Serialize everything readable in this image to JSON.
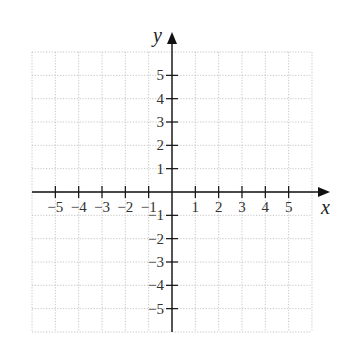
{
  "chart_data": {
    "type": "scatter",
    "title": "",
    "xlabel": "x",
    "ylabel": "y",
    "xlim": [
      -6,
      6
    ],
    "ylim": [
      -6,
      6
    ],
    "grid": true,
    "grid_style": "dotted",
    "x_ticks": [
      -5,
      -4,
      -3,
      -2,
      -1,
      1,
      2,
      3,
      4,
      5
    ],
    "y_ticks": [
      -5,
      -4,
      -3,
      -2,
      -1,
      1,
      2,
      3,
      4,
      5
    ],
    "x_tick_labels": [
      "−5",
      "−4",
      "−3",
      "−2",
      "−1",
      "1",
      "2",
      "3",
      "4",
      "5"
    ],
    "y_tick_labels": [
      "−5",
      "−4",
      "−3",
      "−2",
      "−1",
      "1",
      "2",
      "3",
      "4",
      "5"
    ],
    "series": [],
    "legend": null
  },
  "colors": {
    "axis": "#111111",
    "grid": "#b8b8b8",
    "label": "#333333",
    "background": "#ffffff"
  }
}
